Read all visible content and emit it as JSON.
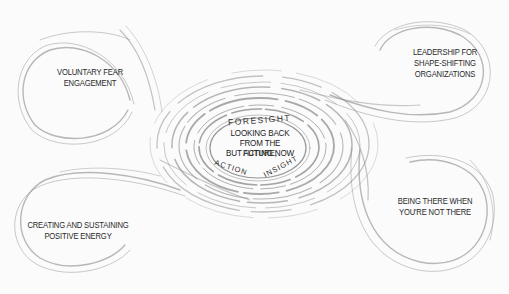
{
  "diagram": {
    "center": {
      "arc_top": "FORESIGHT",
      "lines": [
        "LOOKING BACK",
        "FROM THE FUTURE,",
        "BUT ACTING NOW"
      ],
      "arc_bottom_left": "ACTION",
      "arc_bottom_right": "INSIGHT"
    },
    "nodes": [
      {
        "id": "top-left",
        "lines": [
          "VOLUNTARY FEAR",
          "ENGAGEMENT"
        ]
      },
      {
        "id": "top-right",
        "lines": [
          "LEADERSHIP FOR",
          "SHAPE-SHIFTING",
          "ORGANIZATIONS"
        ]
      },
      {
        "id": "bottom-right",
        "lines": [
          "BEING THERE WHEN",
          "YOU'RE NOT THERE"
        ]
      },
      {
        "id": "bottom-left",
        "lines": [
          "CREATING AND SUSTAINING",
          "POSITIVE ENERGY"
        ]
      }
    ],
    "colors": {
      "background": "#fbfbfb",
      "stroke": "#8a8a8a",
      "text": "#2a2a2a"
    }
  }
}
